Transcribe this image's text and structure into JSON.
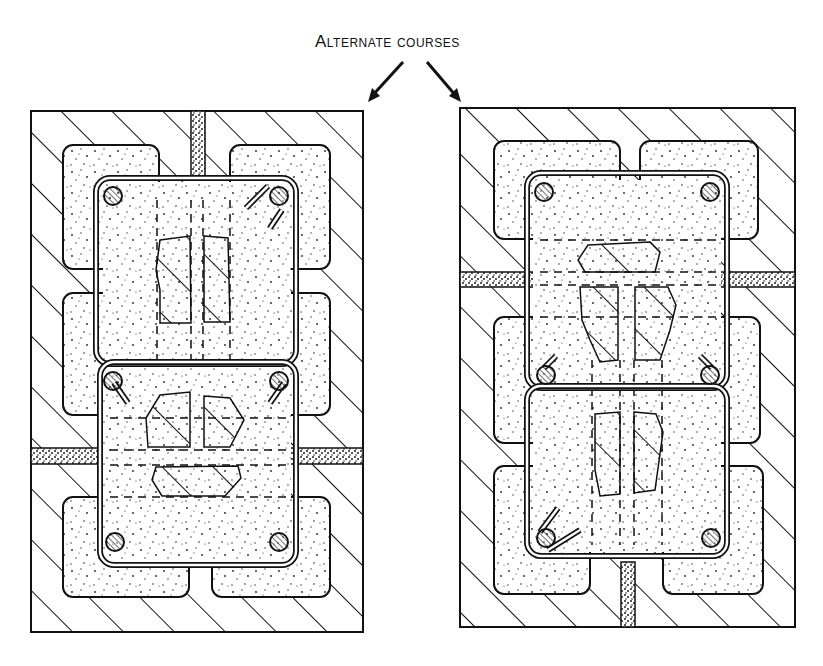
{
  "figure": {
    "caption": "Alternate courses",
    "panels": [
      {
        "id": "left",
        "description": "Masonry pilaster section, course A: grouted core with four corner reinforcing bars and closed ties",
        "bars": 6,
        "ties": 2,
        "mortar_joint": "horizontal-lower"
      },
      {
        "id": "right",
        "description": "Masonry pilaster section, course B: grouted core with four corner reinforcing bars and closed ties",
        "bars": 6,
        "ties": 2,
        "mortar_joint": "horizontal-upper"
      }
    ],
    "legend": {
      "hatch": "brick masonry",
      "stipple": "grout / concrete",
      "circle_hatch": "reinforcing bar"
    }
  }
}
